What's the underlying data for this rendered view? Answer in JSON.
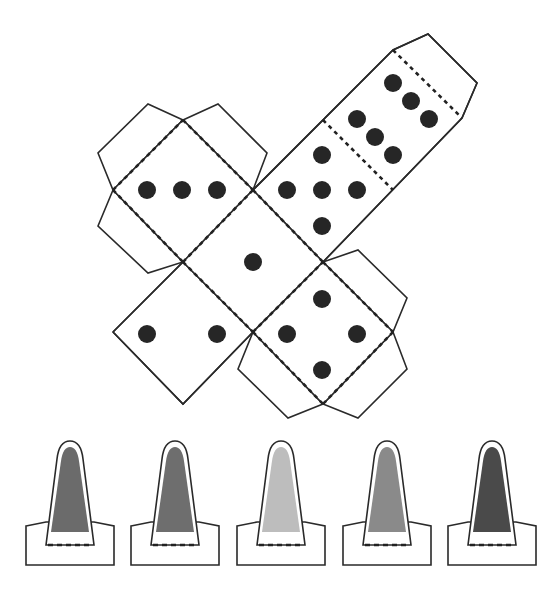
{
  "scene": {
    "title": "Paper die net and pawn cutouts",
    "background": "#ffffff"
  },
  "die_net": {
    "faces": [
      {
        "id": "face-three",
        "pips": 3
      },
      {
        "id": "face-one",
        "pips": 1
      },
      {
        "id": "face-five",
        "pips": 5
      },
      {
        "id": "face-six",
        "pips": 6
      },
      {
        "id": "face-two",
        "pips": 2
      },
      {
        "id": "face-four",
        "pips": 4
      }
    ],
    "pip_color": "#262626",
    "line_color": "#2a2a2a"
  },
  "pawns": [
    {
      "id": "pawn-1",
      "fill": "#6b6b6b"
    },
    {
      "id": "pawn-2",
      "fill": "#6e6e6e"
    },
    {
      "id": "pawn-3",
      "fill": "#bdbdbd"
    },
    {
      "id": "pawn-4",
      "fill": "#8a8a8a"
    },
    {
      "id": "pawn-5",
      "fill": "#4a4a4a"
    }
  ]
}
